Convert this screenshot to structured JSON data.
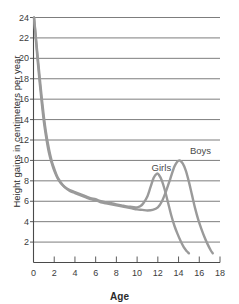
{
  "chart_data": {
    "type": "line",
    "title": "",
    "subtitle": "",
    "xlabel": "Age",
    "ylabel": "Height gains in centimeters per year",
    "xlim": [
      0,
      18
    ],
    "ylim": [
      0,
      24
    ],
    "xticks": [
      0,
      2,
      4,
      6,
      8,
      10,
      12,
      14,
      16,
      18
    ],
    "yticks": [
      2,
      4,
      6,
      8,
      10,
      12,
      14,
      16,
      18,
      20,
      22,
      24
    ],
    "xtick_labels": [
      "0",
      "2",
      "4",
      "6",
      "8",
      "10",
      "12",
      "14",
      "16",
      "18"
    ],
    "ytick_labels": [
      "2",
      "4",
      "6",
      "8",
      "10",
      "12",
      "14",
      "16",
      "18",
      "20",
      "22",
      "24"
    ],
    "grid": "horizontal",
    "legend_position": "inline-annotations",
    "line_color": "#9a9a9a",
    "grid_color": "#6e6e6e",
    "axis_color": "#4a4a4a",
    "series": [
      {
        "name": "Girls",
        "label": "Girls",
        "label_x": 11.4,
        "label_y": 9.3,
        "points": [
          [
            0.05,
            24.0
          ],
          [
            0.2,
            22.2
          ],
          [
            0.4,
            19.8
          ],
          [
            0.6,
            17.6
          ],
          [
            0.8,
            15.6
          ],
          [
            1.0,
            13.8
          ],
          [
            1.2,
            12.4
          ],
          [
            1.4,
            11.2
          ],
          [
            1.6,
            10.3
          ],
          [
            1.8,
            9.6
          ],
          [
            2.0,
            9.0
          ],
          [
            2.3,
            8.3
          ],
          [
            2.6,
            7.8
          ],
          [
            3.0,
            7.4
          ],
          [
            3.5,
            7.1
          ],
          [
            4.0,
            6.9
          ],
          [
            4.5,
            6.7
          ],
          [
            5.0,
            6.5
          ],
          [
            5.5,
            6.3
          ],
          [
            6.0,
            6.2
          ],
          [
            6.5,
            6.0
          ],
          [
            7.0,
            5.9
          ],
          [
            7.5,
            5.8
          ],
          [
            8.0,
            5.7
          ],
          [
            8.5,
            5.6
          ],
          [
            9.0,
            5.5
          ],
          [
            9.5,
            5.45
          ],
          [
            10.0,
            5.4
          ],
          [
            10.3,
            5.5
          ],
          [
            10.6,
            5.8
          ],
          [
            11.0,
            6.5
          ],
          [
            11.3,
            7.4
          ],
          [
            11.6,
            8.3
          ],
          [
            11.9,
            8.7
          ],
          [
            12.1,
            8.6
          ],
          [
            12.4,
            8.0
          ],
          [
            12.7,
            7.0
          ],
          [
            13.0,
            5.8
          ],
          [
            13.3,
            4.6
          ],
          [
            13.6,
            3.6
          ],
          [
            13.9,
            2.8
          ],
          [
            14.2,
            2.1
          ],
          [
            14.5,
            1.5
          ],
          [
            14.8,
            1.1
          ],
          [
            15.0,
            0.9
          ]
        ]
      },
      {
        "name": "Boys",
        "label": "Boys",
        "label_x": 15.1,
        "label_y": 10.9,
        "points": [
          [
            0.05,
            24.0
          ],
          [
            0.2,
            22.4
          ],
          [
            0.4,
            20.2
          ],
          [
            0.6,
            18.1
          ],
          [
            0.8,
            16.1
          ],
          [
            1.0,
            14.3
          ],
          [
            1.2,
            12.8
          ],
          [
            1.4,
            11.6
          ],
          [
            1.6,
            10.6
          ],
          [
            1.8,
            9.8
          ],
          [
            2.0,
            9.2
          ],
          [
            2.3,
            8.4
          ],
          [
            2.6,
            7.9
          ],
          [
            3.0,
            7.4
          ],
          [
            3.5,
            7.0
          ],
          [
            4.0,
            6.8
          ],
          [
            4.5,
            6.6
          ],
          [
            5.0,
            6.4
          ],
          [
            5.5,
            6.2
          ],
          [
            6.0,
            6.1
          ],
          [
            6.5,
            5.9
          ],
          [
            7.0,
            5.8
          ],
          [
            7.5,
            5.7
          ],
          [
            8.0,
            5.6
          ],
          [
            8.5,
            5.5
          ],
          [
            9.0,
            5.4
          ],
          [
            9.5,
            5.3
          ],
          [
            10.0,
            5.2
          ],
          [
            10.5,
            5.15
          ],
          [
            11.0,
            5.1
          ],
          [
            11.5,
            5.15
          ],
          [
            12.0,
            5.4
          ],
          [
            12.4,
            6.0
          ],
          [
            12.8,
            7.0
          ],
          [
            13.2,
            8.2
          ],
          [
            13.6,
            9.4
          ],
          [
            13.9,
            9.9
          ],
          [
            14.1,
            10.0
          ],
          [
            14.4,
            9.7
          ],
          [
            14.7,
            9.0
          ],
          [
            15.0,
            7.9
          ],
          [
            15.3,
            6.6
          ],
          [
            15.6,
            5.3
          ],
          [
            15.9,
            4.2
          ],
          [
            16.2,
            3.3
          ],
          [
            16.5,
            2.5
          ],
          [
            16.8,
            1.8
          ],
          [
            17.1,
            1.2
          ],
          [
            17.3,
            0.9
          ]
        ]
      }
    ]
  }
}
